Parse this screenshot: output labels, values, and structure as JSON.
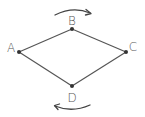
{
  "diagram": {
    "title": "",
    "colors": {
      "edge": "#555555",
      "vertex": "#333333",
      "label": "#555555",
      "arrow": "#444444"
    },
    "vertices": [
      {
        "id": "A",
        "label": "A",
        "x": 19,
        "y": 52
      },
      {
        "id": "B",
        "label": "B",
        "x": 72,
        "y": 29
      },
      {
        "id": "C",
        "label": "C",
        "x": 126,
        "y": 52
      },
      {
        "id": "D",
        "label": "D",
        "x": 72,
        "y": 86
      }
    ],
    "edges": [
      {
        "from": "A",
        "to": "B"
      },
      {
        "from": "B",
        "to": "C"
      },
      {
        "from": "C",
        "to": "D"
      },
      {
        "from": "D",
        "to": "A"
      }
    ],
    "rotation_arrows": [
      {
        "position": "top",
        "direction": "clockwise",
        "points_to": "right"
      },
      {
        "position": "bottom",
        "direction": "clockwise",
        "points_to": "left"
      }
    ],
    "labels": {
      "A": "A",
      "B": "B",
      "C": "C",
      "D": "D"
    }
  }
}
